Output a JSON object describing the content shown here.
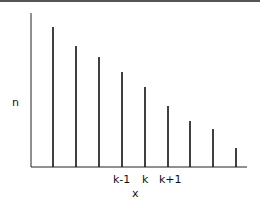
{
  "chart_data": {
    "type": "bar",
    "title": "",
    "xlabel": "x",
    "ylabel": "n",
    "grid": false,
    "legend": null,
    "categories": [
      "",
      "",
      "",
      "k-1",
      "k",
      "k+1",
      "",
      "",
      ""
    ],
    "values": [
      140,
      121,
      110,
      95,
      80,
      61,
      46,
      38,
      19
    ],
    "tick_labels": [
      {
        "index": 3,
        "label": "k-1"
      },
      {
        "index": 4,
        "label": "k"
      },
      {
        "index": 5,
        "label": "k+1"
      }
    ],
    "style": "stem lines (spikes)",
    "ylim": [
      0,
      154
    ]
  },
  "labels": {
    "ylabel": "n",
    "xlabel": "x",
    "tick_km1": "k-1",
    "tick_k": "k",
    "tick_kp1": "k+1"
  }
}
